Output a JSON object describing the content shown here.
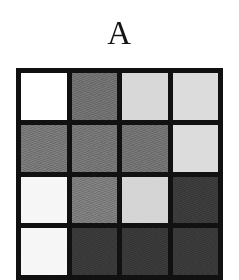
{
  "figure": {
    "panel_label": "A",
    "background_color": "#ffffff",
    "grid_line_color": "#111111"
  },
  "chart_data": {
    "type": "heatmap",
    "title": "A",
    "xlabel": "",
    "ylabel": "",
    "grid": true,
    "legend": "none",
    "rows": 4,
    "columns": 4,
    "row_labels": [
      "1",
      "2",
      "3",
      "4"
    ],
    "column_labels": [
      "1",
      "2",
      "3",
      "4"
    ],
    "colormap": "grayscale",
    "value_range": [
      0,
      1
    ],
    "note": "Grayscale intensity matrix; value 1 = white, value 0 = black. Bottom row is clipped by the image edge.",
    "values": [
      [
        1.0,
        0.43,
        0.85,
        0.86
      ],
      [
        0.46,
        0.45,
        0.44,
        0.86
      ],
      [
        0.97,
        0.48,
        0.84,
        0.23
      ],
      [
        0.97,
        0.22,
        0.22,
        0.22
      ]
    ],
    "cell_colors": [
      [
        "#ffffff",
        "#6e6e6e",
        "#d8d8d8",
        "#dcdcdc"
      ],
      [
        "#757575",
        "#737373",
        "#707070",
        "#dcdcdc"
      ],
      [
        "#f7f7f7",
        "#7a7a7a",
        "#d5d5d5",
        "#3a3a3a"
      ],
      [
        "#f7f7f7",
        "#383838",
        "#373737",
        "#383838"
      ]
    ],
    "cells": [
      {
        "row": 1,
        "col": 1,
        "value": 1.0,
        "color": "#ffffff",
        "tone": "white"
      },
      {
        "row": 1,
        "col": 2,
        "value": 0.43,
        "color": "#6e6e6e",
        "tone": "dark-gray"
      },
      {
        "row": 1,
        "col": 3,
        "value": 0.85,
        "color": "#d8d8d8",
        "tone": "light-gray"
      },
      {
        "row": 1,
        "col": 4,
        "value": 0.86,
        "color": "#dcdcdc",
        "tone": "light-gray"
      },
      {
        "row": 2,
        "col": 1,
        "value": 0.46,
        "color": "#757575",
        "tone": "medium-gray"
      },
      {
        "row": 2,
        "col": 2,
        "value": 0.45,
        "color": "#737373",
        "tone": "medium-gray"
      },
      {
        "row": 2,
        "col": 3,
        "value": 0.44,
        "color": "#707070",
        "tone": "medium-gray"
      },
      {
        "row": 2,
        "col": 4,
        "value": 0.86,
        "color": "#dcdcdc",
        "tone": "light-gray"
      },
      {
        "row": 3,
        "col": 1,
        "value": 0.97,
        "color": "#f7f7f7",
        "tone": "near-white"
      },
      {
        "row": 3,
        "col": 2,
        "value": 0.48,
        "color": "#7a7a7a",
        "tone": "medium-gray"
      },
      {
        "row": 3,
        "col": 3,
        "value": 0.84,
        "color": "#d5d5d5",
        "tone": "light-gray"
      },
      {
        "row": 3,
        "col": 4,
        "value": 0.23,
        "color": "#3a3a3a",
        "tone": "very-dark-gray"
      },
      {
        "row": 4,
        "col": 1,
        "value": 0.97,
        "color": "#f7f7f7",
        "tone": "near-white"
      },
      {
        "row": 4,
        "col": 2,
        "value": 0.22,
        "color": "#383838",
        "tone": "very-dark-gray"
      },
      {
        "row": 4,
        "col": 3,
        "value": 0.22,
        "color": "#373737",
        "tone": "very-dark-gray"
      },
      {
        "row": 4,
        "col": 4,
        "value": 0.22,
        "color": "#383838",
        "tone": "very-dark-gray"
      }
    ]
  }
}
